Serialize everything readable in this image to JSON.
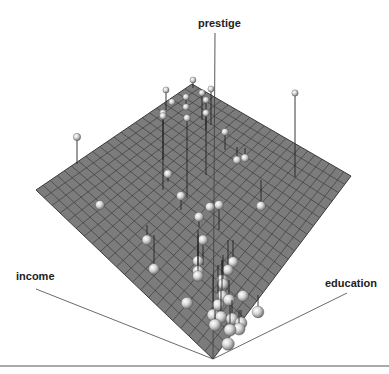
{
  "chart_data": {
    "type": "scatter3d",
    "title": "",
    "axes": {
      "x": "income",
      "y": "education",
      "z": "prestige"
    },
    "regression_plane": true,
    "grid": true,
    "colors": {
      "plane": "#7a7a7a",
      "grid": "#3e3e3e",
      "sphere": "#d8d8d8",
      "axis": "#333333"
    },
    "points_screen": [
      {
        "x": 77,
        "y": 137,
        "base_y": 164
      },
      {
        "x": 100,
        "y": 205,
        "base_y": 205
      },
      {
        "x": 166,
        "y": 90,
        "base_y": 110
      },
      {
        "x": 193,
        "y": 80,
        "base_y": 88
      },
      {
        "x": 211,
        "y": 89,
        "base_y": 125
      },
      {
        "x": 172,
        "y": 102,
        "base_y": 105
      },
      {
        "x": 186,
        "y": 97,
        "base_y": 104
      },
      {
        "x": 202,
        "y": 93,
        "base_y": 120
      },
      {
        "x": 186,
        "y": 107,
        "base_y": 110
      },
      {
        "x": 163,
        "y": 113,
        "base_y": 160
      },
      {
        "x": 206,
        "y": 100,
        "base_y": 175
      },
      {
        "x": 163,
        "y": 116,
        "base_y": 190
      },
      {
        "x": 187,
        "y": 118,
        "base_y": 198
      },
      {
        "x": 206,
        "y": 113,
        "base_y": 130
      },
      {
        "x": 295,
        "y": 93,
        "base_y": 177
      },
      {
        "x": 225,
        "y": 132,
        "base_y": 150
      },
      {
        "x": 237,
        "y": 160,
        "base_y": 147
      },
      {
        "x": 245,
        "y": 158,
        "base_y": 148
      },
      {
        "x": 168,
        "y": 174,
        "base_y": 182
      },
      {
        "x": 181,
        "y": 196,
        "base_y": 210
      },
      {
        "x": 210,
        "y": 207,
        "base_y": 207
      },
      {
        "x": 199,
        "y": 217,
        "base_y": 227
      },
      {
        "x": 219,
        "y": 205,
        "base_y": 230
      },
      {
        "x": 261,
        "y": 206,
        "base_y": 180
      },
      {
        "x": 147,
        "y": 240,
        "base_y": 225
      },
      {
        "x": 154,
        "y": 269,
        "base_y": 235
      },
      {
        "x": 203,
        "y": 240,
        "base_y": 265
      },
      {
        "x": 198,
        "y": 261,
        "base_y": 235
      },
      {
        "x": 198,
        "y": 271,
        "base_y": 230
      },
      {
        "x": 228,
        "y": 270,
        "base_y": 240
      },
      {
        "x": 198,
        "y": 276,
        "base_y": 245
      },
      {
        "x": 222,
        "y": 280,
        "base_y": 260
      },
      {
        "x": 233,
        "y": 262,
        "base_y": 240
      },
      {
        "x": 187,
        "y": 303,
        "base_y": 300
      },
      {
        "x": 223,
        "y": 284,
        "base_y": 255
      },
      {
        "x": 222,
        "y": 296,
        "base_y": 260
      },
      {
        "x": 218,
        "y": 305,
        "base_y": 265
      },
      {
        "x": 213,
        "y": 315,
        "base_y": 275
      },
      {
        "x": 221,
        "y": 317,
        "base_y": 290
      },
      {
        "x": 229,
        "y": 300,
        "base_y": 280
      },
      {
        "x": 243,
        "y": 296,
        "base_y": 292
      },
      {
        "x": 258,
        "y": 312,
        "base_y": 295
      },
      {
        "x": 232,
        "y": 319,
        "base_y": 300
      },
      {
        "x": 241,
        "y": 323,
        "base_y": 310
      },
      {
        "x": 239,
        "y": 329,
        "base_y": 310
      },
      {
        "x": 230,
        "y": 330,
        "base_y": 305
      },
      {
        "x": 228,
        "y": 344,
        "base_y": 340
      },
      {
        "x": 215,
        "y": 325,
        "base_y": 310
      }
    ]
  },
  "labels": {
    "z_axis": "prestige",
    "x_axis": "income",
    "y_axis": "education"
  }
}
